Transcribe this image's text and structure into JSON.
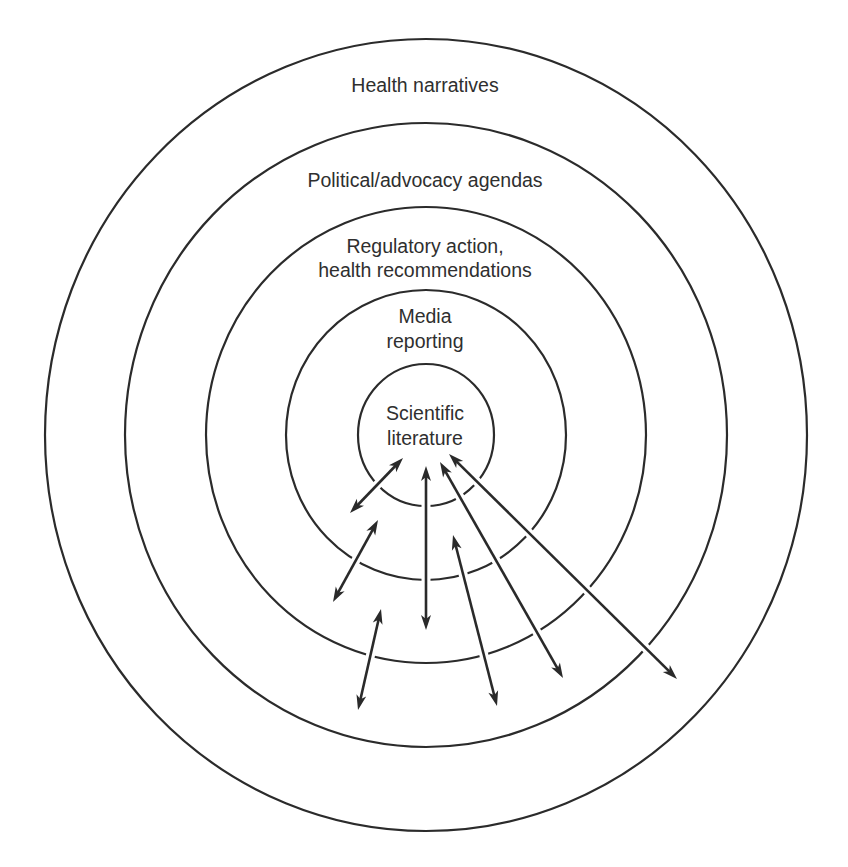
{
  "diagram": {
    "type": "concentric-circles",
    "center": {
      "x": 426,
      "y": 435
    },
    "style": {
      "ring_color": "#2b2b2b",
      "arrow_color": "#2a2a2a",
      "text_color": "#2f2f2f",
      "background": "#ffffff"
    },
    "rings": [
      {
        "id": "health-narratives",
        "rx": 381,
        "ry": 396,
        "lines": [
          "Health narratives"
        ],
        "label_y": [
          92
        ]
      },
      {
        "id": "political-advocacy",
        "rx": 301,
        "ry": 312,
        "lines": [
          "Political/advocacy agendas"
        ],
        "label_y": [
          187
        ]
      },
      {
        "id": "regulatory",
        "rx": 220,
        "ry": 228,
        "lines": [
          "Regulatory action,",
          "health recommendations"
        ],
        "label_y": [
          253,
          277
        ]
      },
      {
        "id": "media",
        "rx": 140,
        "ry": 145,
        "lines": [
          "Media",
          "reporting"
        ],
        "label_y": [
          323,
          348
        ]
      },
      {
        "id": "scientific-literature",
        "rx": 68,
        "ry": 71,
        "lines": [
          "Scientific",
          "literature"
        ],
        "label_y": [
          420,
          445
        ]
      }
    ],
    "arrows": [
      {
        "id": "arrow-1",
        "from": [
          403,
          458
        ],
        "to": [
          350,
          513
        ],
        "bidirectional": true
      },
      {
        "id": "arrow-2",
        "from": [
          378,
          520
        ],
        "to": [
          333,
          602
        ],
        "bidirectional": true
      },
      {
        "id": "arrow-3",
        "from": [
          426,
          466
        ],
        "to": [
          426,
          630
        ],
        "bidirectional": true
      },
      {
        "id": "arrow-4",
        "from": [
          381,
          609
        ],
        "to": [
          358,
          710
        ],
        "bidirectional": true
      },
      {
        "id": "arrow-5",
        "from": [
          453,
          535
        ],
        "to": [
          497,
          706
        ],
        "bidirectional": true
      },
      {
        "id": "arrow-6",
        "from": [
          440,
          462
        ],
        "to": [
          563,
          678
        ],
        "bidirectional": true
      },
      {
        "id": "arrow-7",
        "from": [
          449,
          454
        ],
        "to": [
          677,
          679
        ],
        "bidirectional": true
      }
    ]
  }
}
